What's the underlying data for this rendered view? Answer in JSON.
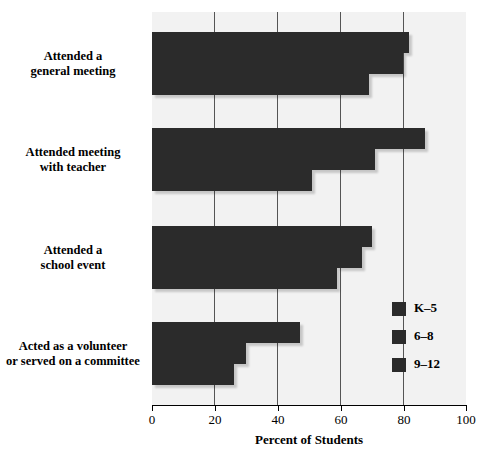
{
  "chart_data": {
    "type": "bar",
    "orientation": "horizontal",
    "title": "",
    "xlabel": "Percent of Students",
    "ylabel": "",
    "xlim": [
      0,
      100
    ],
    "xticks": [
      0,
      20,
      40,
      60,
      80,
      100
    ],
    "xtick_labels": [
      "0",
      "20",
      "40",
      "60",
      "80",
      "100"
    ],
    "grid": true,
    "grid_axis": "x",
    "legend_position": "right-inside",
    "bar_color": "#2b2b2b",
    "plot_background": "#f2f2f2",
    "categories": [
      "Attended a general meeting",
      "Attended meeting with teacher",
      "Attended a school event",
      "Acted as a volunteer or served on a committee"
    ],
    "category_lines": [
      [
        "Attended a",
        "general meeting"
      ],
      [
        "Attended meeting",
        "with teacher"
      ],
      [
        "Attended a",
        "school event"
      ],
      [
        "Acted as a volunteer",
        "or served on a committee"
      ]
    ],
    "series": [
      {
        "name": "K–5",
        "values": [
          82,
          87,
          70,
          47
        ]
      },
      {
        "name": "6–8",
        "values": [
          80,
          71,
          67,
          30
        ]
      },
      {
        "name": "9–12",
        "values": [
          69,
          51,
          59,
          26
        ]
      }
    ]
  },
  "legend": {
    "entries": [
      "K–5",
      "6–8",
      "9–12"
    ]
  },
  "axis": {
    "x_title": "Percent of Students",
    "tick_labels": [
      "0",
      "20",
      "40",
      "60",
      "80",
      "100"
    ]
  }
}
